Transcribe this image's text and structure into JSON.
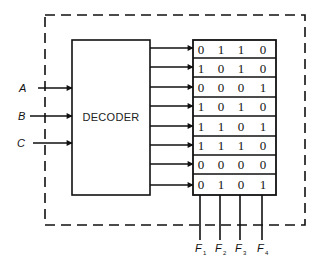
{
  "diagram": {
    "decoder": {
      "label": "DECODER"
    },
    "inputs": [
      {
        "name": "A",
        "y": 88
      },
      {
        "name": "B",
        "y": 116
      },
      {
        "name": "C",
        "y": 143
      }
    ],
    "rom": {
      "rows": [
        [
          "0",
          "1",
          "1",
          "0"
        ],
        [
          "1",
          "0",
          "1",
          "0"
        ],
        [
          "0",
          "0",
          "0",
          "1"
        ],
        [
          "1",
          "0",
          "1",
          "0"
        ],
        [
          "1",
          "1",
          "0",
          "1"
        ],
        [
          "1",
          "1",
          "1",
          "0"
        ],
        [
          "0",
          "0",
          "0",
          "0"
        ],
        [
          "0",
          "1",
          "0",
          "1"
        ]
      ]
    },
    "outputs": [
      {
        "letter": "F",
        "sub": "1"
      },
      {
        "letter": "F",
        "sub": "2"
      },
      {
        "letter": "F",
        "sub": "3"
      },
      {
        "letter": "F",
        "sub": "4"
      }
    ],
    "colors": {
      "line": "#111111",
      "background": "#ffffff"
    }
  }
}
